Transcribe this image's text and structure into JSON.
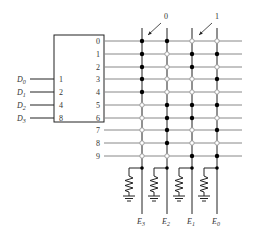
{
  "decoder": {
    "inputs": [
      {
        "name": "D",
        "sub": "0",
        "weight": "1"
      },
      {
        "name": "D",
        "sub": "1",
        "weight": "2"
      },
      {
        "name": "D",
        "sub": "2",
        "weight": "4"
      },
      {
        "name": "D",
        "sub": "3",
        "weight": "8"
      }
    ],
    "outputs": [
      "0",
      "1",
      "2",
      "3",
      "4",
      "5",
      "6",
      "7",
      "8",
      "9"
    ]
  },
  "annotations": {
    "zero_label": "0",
    "one_label": "1"
  },
  "columns": [
    {
      "name": "E",
      "sub": "3"
    },
    {
      "name": "E",
      "sub": "2"
    },
    {
      "name": "E",
      "sub": "1"
    },
    {
      "name": "E",
      "sub": "0"
    }
  ],
  "matrix": [
    [
      1,
      1,
      0,
      0
    ],
    [
      1,
      0,
      1,
      1
    ],
    [
      1,
      0,
      1,
      0
    ],
    [
      1,
      0,
      0,
      1
    ],
    [
      1,
      0,
      0,
      0
    ],
    [
      0,
      1,
      1,
      1
    ],
    [
      0,
      1,
      1,
      0
    ],
    [
      0,
      1,
      0,
      1
    ],
    [
      0,
      1,
      0,
      0
    ],
    [
      0,
      0,
      1,
      1
    ]
  ],
  "colors": {
    "line": "#222222",
    "row_line": "#888888",
    "open_dot": "#999999",
    "filled_dot": "#000000"
  }
}
